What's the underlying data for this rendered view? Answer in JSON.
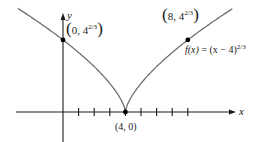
{
  "chart_data": {
    "type": "line",
    "title": "",
    "function_label": "f(x) = (x − 4)^(2/3)",
    "xlabel": "x",
    "ylabel": "y",
    "x_ticks": [
      1,
      2,
      3,
      4,
      5,
      6,
      7,
      8
    ],
    "tick_labels_shown": false,
    "grid": false,
    "xlim": [
      -3,
      11
    ],
    "series": [
      {
        "name": "f(x) = (x - 4)^(2/3)",
        "x": [
          -1.5,
          0,
          1,
          2,
          3,
          3.5,
          4,
          4.5,
          5,
          6,
          7,
          8,
          9.5
        ],
        "y": [
          3.12,
          2.52,
          2.08,
          1.59,
          1.0,
          0.63,
          0,
          0.63,
          1.0,
          1.59,
          2.08,
          2.52,
          3.12
        ]
      }
    ],
    "points": [
      {
        "x": 0,
        "y": 2.52,
        "label": "(0, 4^(2/3))"
      },
      {
        "x": 4,
        "y": 0,
        "label": "(4, 0)"
      },
      {
        "x": 8,
        "y": 2.52,
        "label": "(8, 4^(2/3))"
      }
    ]
  },
  "labels": {
    "y_axis": "y",
    "x_axis": "x",
    "pt_left_open": "(",
    "pt_left_text": "0, 4",
    "pt_left_exp": "2/3",
    "pt_left_close": ")",
    "pt_right_open": "(",
    "pt_right_text": "8, 4",
    "pt_right_exp": "2/3",
    "pt_right_close": ")",
    "cusp": "(4, 0)",
    "func_lhs": "f(x)",
    "func_eq": " = (x − 4)",
    "func_exp": "2/3"
  },
  "colors": {
    "curve": "#6e6e6e",
    "axis": "#1a1a1a",
    "point": "#000000"
  }
}
